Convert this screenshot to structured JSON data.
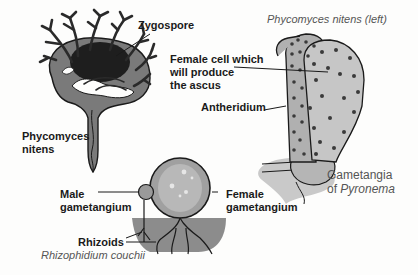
{
  "figure": {
    "phycomyces": {
      "zygospore_label": "Zygospore",
      "name_label": "Phycomyces\nnitens"
    },
    "pyronema": {
      "title_caption": "Phycomyces nitens (left)",
      "female_cell_label": "Female cell which\nwill produce\nthe ascus",
      "antheridium_label": "Antheridium",
      "caption_line1": "Gametangia",
      "caption_line2_prefix": "of ",
      "caption_line2_italic": "Pyronema"
    },
    "rhizophidium": {
      "male_label": "Male\ngametangium",
      "female_label": "Female\ngametangium",
      "rhizoids_label": "Rhizoids",
      "caption": "Rhizophidium couchii"
    }
  },
  "colors": {
    "ink": "#1a1a1a",
    "dark_fill": "#2a2a2a",
    "mid_grey": "#7a7a7a",
    "light_grey": "#bdbdbd",
    "substrate": "#8c8c8c",
    "caption": "#555555"
  }
}
